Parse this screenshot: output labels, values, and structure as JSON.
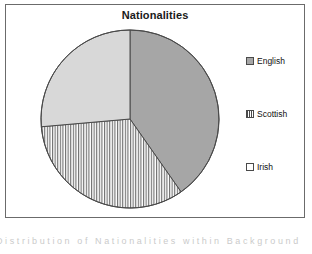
{
  "chart_data": {
    "type": "pie",
    "title": "Nationalities",
    "categories": [
      "English",
      "Scottish",
      "Irish"
    ],
    "values": [
      40,
      27,
      33
    ],
    "units": "percent",
    "legend_position": "right",
    "grid": false,
    "start_angle_deg": 0,
    "direction": "clockwise",
    "slices": [
      {
        "label": "English",
        "value": 40,
        "start_angle_deg": 0,
        "end_angle_deg": 145,
        "fill": "#a6a6a6",
        "pattern": "solid-gray",
        "swatch_pattern": "solid-gray"
      },
      {
        "label": "Irish",
        "value": 33,
        "start_angle_deg": 145,
        "end_angle_deg": 265,
        "fill": "#ffffff",
        "pattern": "vertical-lines",
        "swatch_pattern": "empty"
      },
      {
        "label": "Scottish",
        "value": 27,
        "start_angle_deg": 265,
        "end_angle_deg": 360,
        "fill": "#d8d8d8",
        "pattern": "light-gray",
        "swatch_pattern": "vertical-lines"
      }
    ],
    "xlabel": "",
    "ylabel": ""
  },
  "chart": {
    "title": "Nationalities",
    "frame_border_color": "#6b6b6b",
    "outline_color": "#4a4a4a",
    "background": "#ffffff"
  },
  "legend": {
    "items": [
      {
        "label": "English",
        "swatch": "solid-gray-swatch"
      },
      {
        "label": "Scottish",
        "swatch": "vertical-lines-swatch"
      },
      {
        "label": "Irish",
        "swatch": "empty-swatch"
      }
    ]
  },
  "caption": {
    "text": "Distribution of Nationalities within Background"
  }
}
